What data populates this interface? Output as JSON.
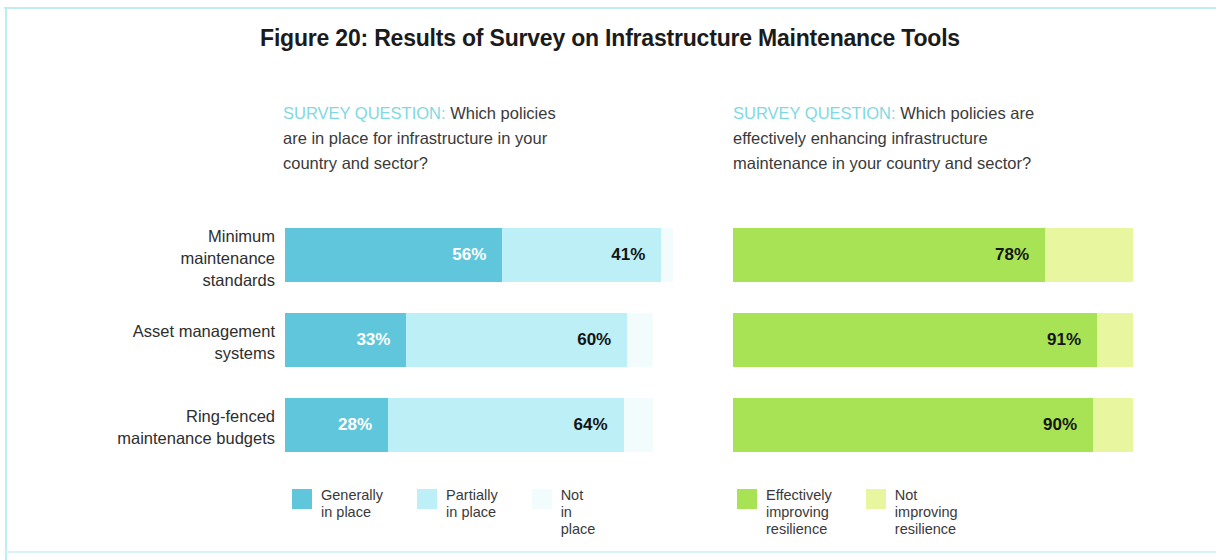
{
  "figure": {
    "title": "Figure 20: Results of Survey on Infrastructure Maintenance Tools"
  },
  "panels": {
    "left": {
      "question_label": "SURVEY QUESTION:",
      "question_text": " Which policies are in place for infrastructure in your country and sector?",
      "legend": [
        {
          "label": "Generally\nin place",
          "color": "#5FC6DC"
        },
        {
          "label": "Partially\nin place",
          "color": "#BDEFF7"
        },
        {
          "label": "Not\nin place",
          "color": "#F3FCFD"
        }
      ]
    },
    "right": {
      "question_label": "SURVEY QUESTION:",
      "question_text": " Which policies are effectively enhancing infrastructure maintenance in your country and sector?",
      "legend": [
        {
          "label": "Effectively\nimproving resilience",
          "color": "#A8E355"
        },
        {
          "label": "Not improving\nresilience",
          "color": "#E8F79F"
        }
      ]
    }
  },
  "rows": [
    {
      "label": "Minimum\nmaintenance\nstandards"
    },
    {
      "label": "Asset management\nsystems"
    },
    {
      "label": "Ring-fenced\nmaintenance budgets"
    }
  ],
  "chart_data": [
    {
      "type": "bar",
      "title": "Which policies are in place for infrastructure in your country and sector?",
      "orientation": "horizontal",
      "stacked": true,
      "unit": "percent",
      "categories": [
        "Minimum maintenance standards",
        "Asset management systems",
        "Ring-fenced maintenance budgets"
      ],
      "series": [
        {
          "name": "Generally in place",
          "color": "#5FC6DC",
          "values": [
            56,
            33,
            28
          ],
          "labels": [
            "56%",
            "33%",
            "28%"
          ]
        },
        {
          "name": "Partially in place",
          "color": "#BDEFF7",
          "values": [
            41,
            60,
            64
          ],
          "labels": [
            "41%",
            "60%",
            "64%"
          ]
        },
        {
          "name": "Not in place",
          "color": "#F3FCFD",
          "values": [
            3,
            7,
            8
          ],
          "labels": [
            "",
            "",
            ""
          ]
        }
      ],
      "xlabel": "",
      "ylabel": "",
      "xlim": [
        0,
        100
      ],
      "grid": false,
      "legend_position": "bottom"
    },
    {
      "type": "bar",
      "title": "Which policies are effectively enhancing infrastructure maintenance in your country and sector?",
      "orientation": "horizontal",
      "stacked": true,
      "unit": "percent",
      "categories": [
        "Minimum maintenance standards",
        "Asset management systems",
        "Ring-fenced maintenance budgets"
      ],
      "series": [
        {
          "name": "Effectively improving resilience",
          "color": "#A8E355",
          "values": [
            78,
            91,
            90
          ],
          "labels": [
            "78%",
            "91%",
            "90%"
          ]
        },
        {
          "name": "Not improving resilience",
          "color": "#E8F79F",
          "values": [
            22,
            9,
            10
          ],
          "labels": [
            "",
            "",
            ""
          ]
        }
      ],
      "xlabel": "",
      "ylabel": "",
      "xlim": [
        0,
        100
      ],
      "grid": false,
      "legend_position": "bottom"
    }
  ]
}
